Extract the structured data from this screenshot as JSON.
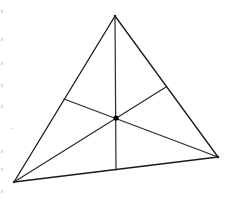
{
  "diagram": {
    "title": "",
    "colors": {
      "background": "#ffffff",
      "stroke": "#1a1a1a",
      "centroid": "#000000"
    },
    "vertices": {
      "top": {
        "x": 115,
        "y": 16
      },
      "bottom_left": {
        "x": 14,
        "y": 182
      },
      "bottom_right": {
        "x": 218,
        "y": 157
      }
    },
    "midpoints": {
      "left_side": {
        "x": 64,
        "y": 99
      },
      "right_side": {
        "x": 166,
        "y": 87
      },
      "bottom_side": {
        "x": 116,
        "y": 170
      }
    },
    "centroid": {
      "x": 116,
      "y": 118,
      "radius": 2.6
    },
    "labels": []
  }
}
